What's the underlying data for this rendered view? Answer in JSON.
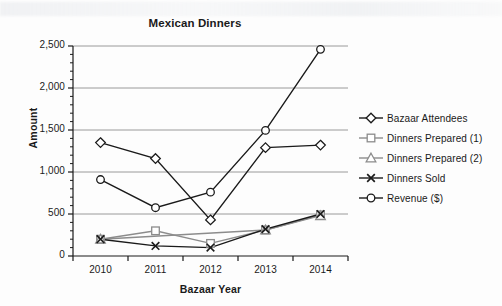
{
  "chart_data": {
    "type": "line",
    "title": "Mexican Dinners",
    "xlabel": "Bazaar Year",
    "ylabel": "Amount",
    "categories": [
      "2010",
      "2011",
      "2012",
      "2013",
      "2014"
    ],
    "ylim": [
      0,
      2500
    ],
    "y_ticks": [
      "0",
      "500",
      "1,000",
      "1,500",
      "2,000",
      "2,500"
    ],
    "y_tick_values": [
      0,
      500,
      1000,
      1500,
      2000,
      2500
    ],
    "y_minor_tick_step": 100,
    "grid": "horizontal",
    "legend_position": "right",
    "series": [
      {
        "name": "Bazaar Attendees",
        "marker": "diamond",
        "color": "#1a1a1a",
        "values": [
          1350,
          1160,
          430,
          1290,
          1320
        ]
      },
      {
        "name": "Dinners Prepared (1)",
        "marker": "square",
        "color": "#8c8c8c",
        "values": [
          200,
          300,
          150,
          310,
          490
        ]
      },
      {
        "name": "Dinners Prepared (2)",
        "marker": "triangle",
        "color": "#8c8c8c",
        "values": [
          200,
          null,
          null,
          310,
          480
        ]
      },
      {
        "name": "Dinners Sold",
        "marker": "x",
        "color": "#1a1a1a",
        "values": [
          200,
          120,
          100,
          320,
          500
        ]
      },
      {
        "name": "Revenue ($)",
        "marker": "circle",
        "color": "#1a1a1a",
        "values": [
          910,
          575,
          760,
          1495,
          2460
        ]
      }
    ]
  },
  "legend": {
    "items": [
      {
        "label": "Bazaar Attendees"
      },
      {
        "label": "Dinners Prepared (1)"
      },
      {
        "label": "Dinners Prepared (2)"
      },
      {
        "label": "Dinners Sold"
      },
      {
        "label": "Revenue ($)"
      }
    ]
  },
  "colors": {
    "axis": "#1a1a1a",
    "grid": "#9a9a9a",
    "dark_series": "#1a1a1a",
    "light_series": "#8c8c8c",
    "background": "#fdfdfd"
  }
}
